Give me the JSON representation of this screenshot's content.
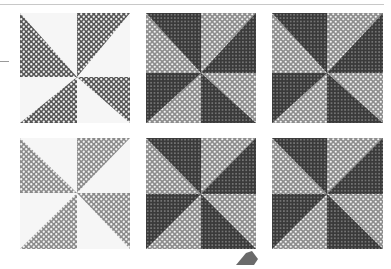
{
  "figure": {
    "colors": {
      "background": "#ffffff",
      "rule": "#c8c8c8",
      "dark_fill": "#3c3c3c",
      "dark_dots": "#8a8a8a",
      "mid_fill": "#6e6e6e",
      "light_fill": "#9a9a9a",
      "light_dots": "#f4f4f4",
      "white_sector": "#f6f6f6"
    },
    "panels": [
      {
        "id": "p1",
        "row": 1,
        "col": 1,
        "x": 20,
        "y": 13,
        "w": 110,
        "h": 110,
        "style": "pinwheel-dark-white"
      },
      {
        "id": "p2",
        "row": 1,
        "col": 2,
        "x": 146,
        "y": 13,
        "w": 110,
        "h": 110,
        "style": "pinwheel-dense-light"
      },
      {
        "id": "p3",
        "row": 1,
        "col": 3,
        "x": 272,
        "y": 13,
        "w": 111,
        "h": 110,
        "style": "pinwheel-dense-light"
      },
      {
        "id": "p4",
        "row": 2,
        "col": 1,
        "x": 20,
        "y": 138,
        "w": 110,
        "h": 111,
        "style": "pinwheel-gray-white"
      },
      {
        "id": "p5",
        "row": 2,
        "col": 2,
        "x": 146,
        "y": 138,
        "w": 110,
        "h": 111,
        "style": "pinwheel-dense-light"
      },
      {
        "id": "p6",
        "row": 2,
        "col": 3,
        "x": 272,
        "y": 138,
        "w": 111,
        "h": 111,
        "style": "pinwheel-dense-light"
      }
    ]
  }
}
